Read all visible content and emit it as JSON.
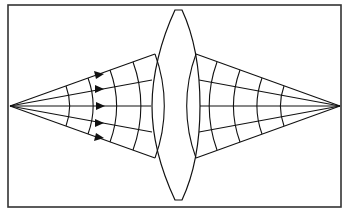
{
  "diagram": {
    "frame": {
      "x": 8,
      "y": 5,
      "w": 333,
      "h": 202
    },
    "source_point": {
      "x": 10,
      "y": 106
    },
    "image_point": {
      "x": 340,
      "y": 106
    },
    "lens": {
      "type": "biconvex",
      "top_y": 10,
      "bottom_y": 200,
      "left_x": 152,
      "right_x": 197,
      "center_x": 178
    },
    "rays_left_hit_y": [
      54,
      80,
      106,
      132,
      158
    ],
    "rays_right_exit_y": [
      54,
      80,
      106,
      132,
      158
    ],
    "left_wavefront_x": [
      67,
      90,
      112,
      135,
      155
    ],
    "right_wavefront_x": [
      218,
      240,
      263,
      285
    ],
    "arrow_x": 100,
    "colors": {
      "line": "#111111",
      "frame": "#333333",
      "background": "#ffffff"
    }
  }
}
